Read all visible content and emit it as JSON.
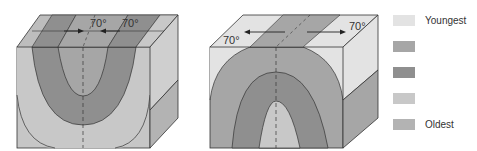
{
  "figure": {
    "syncline": {
      "name": "Syncline block",
      "dip_left_label": "70°",
      "dip_right_label": "70°"
    },
    "anticline": {
      "name": "Anticline block",
      "dip_left_label": "70°",
      "dip_right_label": "70°"
    }
  },
  "legend": {
    "items": [
      {
        "label": "Youngest",
        "color": "#e3e3e3"
      },
      {
        "label": "",
        "color": "#a6a6a6"
      },
      {
        "label": "",
        "color": "#8f8f8f"
      },
      {
        "label": "",
        "color": "#c8c8c8"
      },
      {
        "label": "Oldest",
        "color": "#b3b3b3"
      }
    ]
  },
  "colors": {
    "youngest": "#e3e3e3",
    "layer2": "#a6a6a6",
    "layer3": "#8f8f8f",
    "layer4": "#c8c8c8",
    "oldest": "#b3b3b3",
    "line": "#333333"
  }
}
